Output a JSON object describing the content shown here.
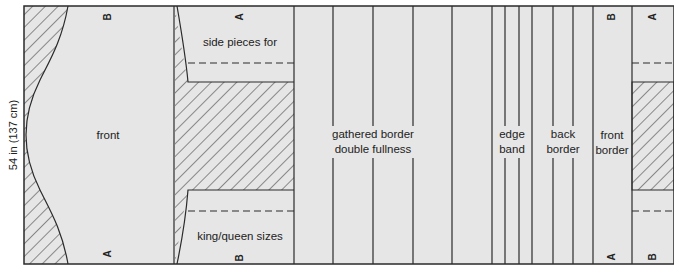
{
  "diagram": {
    "dimension_label": "54 in (137 cm)",
    "colors": {
      "fabric": "#e6e6e6",
      "outline": "#2a2a2a",
      "hatch": "#2a2a2a",
      "background": "#ffffff"
    },
    "pieces": {
      "front": {
        "label": "front",
        "top_mark": "B",
        "bottom_mark": "A"
      },
      "side_pieces": {
        "label_top": "side pieces for",
        "label_bottom": "king/queen sizes",
        "top_mark": "A",
        "bottom_mark": "B"
      },
      "gathered_border": {
        "line1": "gathered border",
        "line2": "double fullness"
      },
      "edge_band": {
        "line1": "edge",
        "line2": "band"
      },
      "back_border": {
        "line1": "back",
        "line2": "border"
      },
      "front_border": {
        "line1": "front",
        "line2": "border",
        "top_mark": "B",
        "bottom_mark": "A"
      },
      "end_piece": {
        "top_mark": "A",
        "bottom_mark": "B"
      }
    }
  }
}
